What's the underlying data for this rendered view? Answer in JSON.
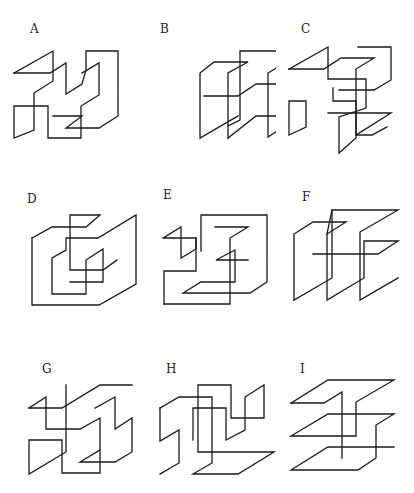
{
  "figures": [
    {
      "id": "A",
      "label": "A"
    },
    {
      "id": "B",
      "label": "B"
    },
    {
      "id": "C",
      "label": "C"
    },
    {
      "id": "D",
      "label": "D"
    },
    {
      "id": "E",
      "label": "E"
    },
    {
      "id": "F",
      "label": "F"
    },
    {
      "id": "G",
      "label": "G"
    },
    {
      "id": "H",
      "label": "H"
    },
    {
      "id": "I",
      "label": "I"
    }
  ]
}
